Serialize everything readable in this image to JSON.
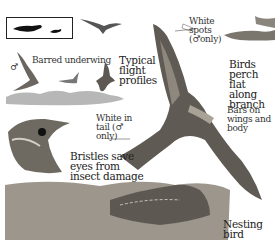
{
  "illustration": {
    "subject": "Nightjar field guide plate",
    "labels": {
      "barred_underwing": "Barred underwing",
      "male_symbol": "♂",
      "typical_flight_profiles": "Typical\nflight\nprofiles",
      "white_spots": "White\nspots\n(♂only)",
      "birds_perch": "Birds perch\nflat along\nbranch",
      "bars_on_wings": "Bars on\nwings and body",
      "white_in_tail": "White in\ntail (♂\nonly)",
      "bristles": "Bristles save\neyes from\ninsect damage",
      "nesting_bird": "Nesting\nbird"
    },
    "colors": {
      "ink": "#222222",
      "feather_dark": "#5a554f",
      "feather_mid": "#8a847b",
      "feather_light": "#c9c3b8",
      "background": "#ffffff"
    }
  }
}
